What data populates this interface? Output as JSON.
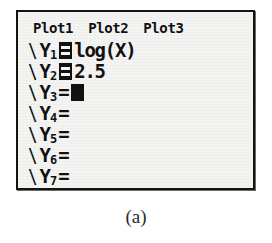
{
  "device": {
    "screen_name": "y-equals-editor"
  },
  "plot_row": {
    "items": [
      {
        "label": "Plot1",
        "highlighted": false
      },
      {
        "label": "Plot2",
        "highlighted": false
      },
      {
        "label": "Plot3",
        "highlighted": false
      }
    ]
  },
  "functions": [
    {
      "slash": "\\",
      "var": "Y",
      "subscript": "1",
      "equals": "=",
      "selected": true,
      "expression": "log(X)",
      "cursor": false
    },
    {
      "slash": "\\",
      "var": "Y",
      "subscript": "2",
      "equals": "=",
      "selected": true,
      "expression": "2.5",
      "cursor": false
    },
    {
      "slash": "\\",
      "var": "Y",
      "subscript": "3",
      "equals": "=",
      "selected": false,
      "expression": "",
      "cursor": true
    },
    {
      "slash": "\\",
      "var": "Y",
      "subscript": "4",
      "equals": "=",
      "selected": false,
      "expression": "",
      "cursor": false
    },
    {
      "slash": "\\",
      "var": "Y",
      "subscript": "5",
      "equals": "=",
      "selected": false,
      "expression": "",
      "cursor": false
    },
    {
      "slash": "\\",
      "var": "Y",
      "subscript": "6",
      "equals": "=",
      "selected": false,
      "expression": "",
      "cursor": false
    },
    {
      "slash": "\\",
      "var": "Y",
      "subscript": "7",
      "equals": "=",
      "selected": false,
      "expression": "",
      "cursor": false
    }
  ],
  "caption": {
    "label": "(a)"
  },
  "colors": {
    "lcd_background": "#f4f4f2",
    "lcd_ink": "#111110",
    "frame": "#14130f",
    "page_background": "#ffffff",
    "caption_text": "#2b2b2b"
  }
}
